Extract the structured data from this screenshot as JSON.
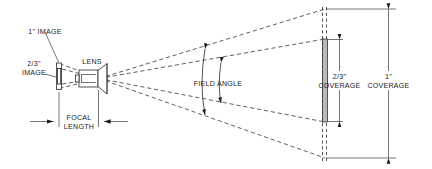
{
  "diagram": {
    "type": "optical-schematic",
    "background_color": "#ffffff",
    "line_color": "#1a1a1a",
    "ray_color": "#2b2b2b",
    "target_fill_color": "#b9b9b9",
    "labels": {
      "image_1in": "1\" IMAGE",
      "image_two_thirds_line1": "2/3\"",
      "image_two_thirds_line2": "IMAGE",
      "lens": "LENS",
      "focal_length_line1": "FOCAL",
      "focal_length_line2": "LENGTH",
      "field_angle": "FIELD ANGLE",
      "coverage_two_thirds_line1": "2/3\"",
      "coverage_two_thirds_line2": "COVERAGE",
      "coverage_1in_line1": "1\"",
      "coverage_1in_line2": "COVERAGE"
    },
    "components": [
      {
        "name": "image-plane-1in",
        "label": "1\" IMAGE",
        "description": "Outer taller image sensor rectangle at the focal plane"
      },
      {
        "name": "image-plane-two-thirds",
        "label": "2/3\" IMAGE",
        "description": "Inner shorter image sensor rectangle at the focal plane"
      },
      {
        "name": "lens-assembly",
        "label": "LENS",
        "description": "Lens barrel with cone element"
      },
      {
        "name": "target-plane",
        "description": "Vertical dashed target plane at right"
      },
      {
        "name": "coverage-bar-two-thirds",
        "label": "2/3\" COVERAGE",
        "description": "Gray vertical bar showing 2/3 inch format coverage height"
      }
    ],
    "dimensions": [
      {
        "name": "focal-length",
        "label": "FOCAL LENGTH",
        "orientation": "horizontal",
        "from": "image plane",
        "to": "lens"
      },
      {
        "name": "coverage-two-thirds",
        "label": "2/3\" COVERAGE",
        "orientation": "vertical",
        "at": "target plane"
      },
      {
        "name": "coverage-1in",
        "label": "1\" COVERAGE",
        "orientation": "vertical",
        "at": "target plane"
      }
    ],
    "angles": [
      {
        "name": "field-angle",
        "label": "FIELD ANGLE",
        "count": 2,
        "description": "Two arc arrows spanning the inner and outer ray cones"
      }
    ]
  }
}
